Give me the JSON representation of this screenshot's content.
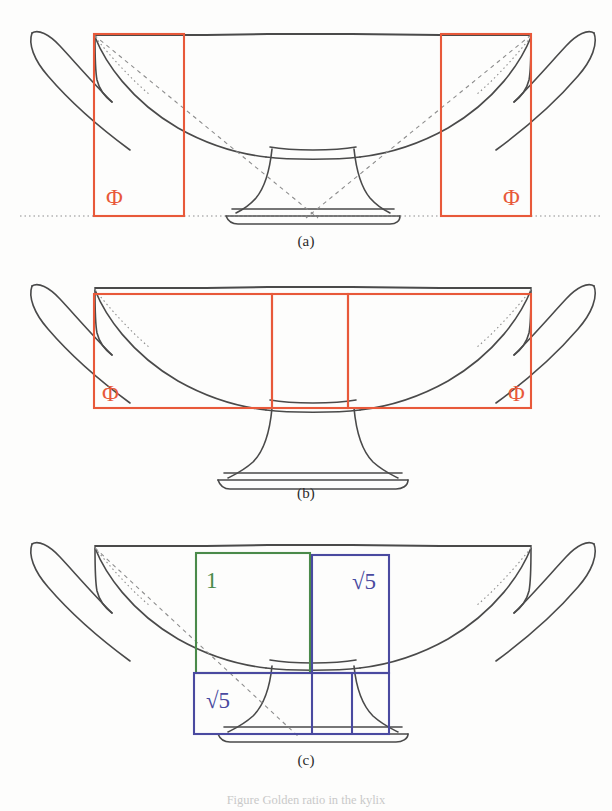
{
  "figure": {
    "caption": "Figure  Golden ratio in the kylix",
    "background_color": "#fdfdfc",
    "drawing_color": "#4a4a4a",
    "colors": {
      "orange": "#e8593a",
      "green": "#4a8a4a",
      "blue": "#4a4aa0",
      "ink": "#4a4a4a",
      "dotted": "#9a9a9a"
    }
  },
  "panels": [
    {
      "id": "a",
      "label": "(a)",
      "object": "kylix-profile",
      "overlay_color": "#e8593a",
      "rectangles": [
        {
          "name": "left-phi-rectangle",
          "x": 94,
          "y": 34,
          "w": 90,
          "h": 182,
          "label": "Φ",
          "label_x": 106,
          "label_y": 203
        },
        {
          "name": "right-phi-rectangle",
          "x": 441,
          "y": 34,
          "w": 90,
          "h": 182,
          "label": "Φ",
          "label_x": 505,
          "label_y": 203
        }
      ],
      "guides": [
        "baseline-dotted",
        "diagonal-left",
        "diagonal-right"
      ]
    },
    {
      "id": "b",
      "label": "(b)",
      "object": "kylix-profile",
      "overlay_color": "#e8593a",
      "rectangles": [
        {
          "name": "left-phi-rectangle",
          "x": 94,
          "y": 294,
          "w": 178,
          "h": 114,
          "label": "Φ",
          "label_x": 104,
          "label_y": 393
        },
        {
          "name": "center-rectangle",
          "x": 272,
          "y": 294,
          "w": 76,
          "h": 114,
          "label": "",
          "label_x": 0,
          "label_y": 0
        },
        {
          "name": "right-phi-rectangle",
          "x": 348,
          "y": 294,
          "w": 183,
          "h": 114,
          "label": "Φ",
          "label_x": 510,
          "label_y": 393
        }
      ],
      "guides": []
    },
    {
      "id": "c",
      "label": "(c)",
      "object": "kylix-profile",
      "rectangles": [
        {
          "name": "unit-square-green",
          "x": 196,
          "y": 553,
          "w": 114,
          "h": 120,
          "color": "#4a8a4a",
          "label": "1",
          "label_x": 210,
          "label_y": 585
        },
        {
          "name": "root5-rectangle-upper-blue",
          "x": 312,
          "y": 555,
          "w": 77,
          "h": 118,
          "color": "#4a4aa0",
          "label": "√5",
          "label_x": 357,
          "label_y": 586
        },
        {
          "name": "root5-rectangle-lower-blue",
          "x": 194,
          "y": 673,
          "w": 195,
          "h": 61,
          "color": "#4a4aa0",
          "label": "√5",
          "label_x": 212,
          "label_y": 704
        },
        {
          "name": "inner-divider-rectangle",
          "x": 312,
          "y": 673,
          "w": 40,
          "h": 61,
          "color": "#4a4aa0",
          "label": "",
          "label_x": 0,
          "label_y": 0
        }
      ],
      "guides": [
        "diagonal-dashed"
      ]
    }
  ],
  "labels": {
    "phi_symbol": "Φ",
    "one": "1",
    "root_five": "√5",
    "panel_a": "(a)",
    "panel_b": "(b)",
    "panel_c": "(c)"
  }
}
